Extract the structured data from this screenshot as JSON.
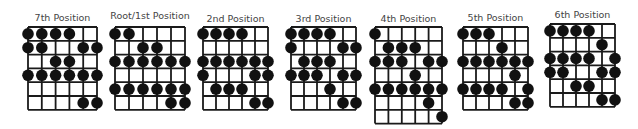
{
  "colors": {
    "line": "#1a1a1a",
    "dot": "#111111",
    "title": "#444444"
  },
  "diagrams": [
    {
      "title": "7th Position",
      "strings": 6,
      "frets": 6,
      "dots": [
        [
          0,
          0
        ],
        [
          0,
          1
        ],
        [
          0,
          2
        ],
        [
          0,
          3
        ],
        [
          1,
          0
        ],
        [
          1,
          1
        ],
        [
          1,
          4
        ],
        [
          1,
          5
        ],
        [
          2,
          2
        ],
        [
          2,
          3
        ],
        [
          3,
          0
        ],
        [
          3,
          1
        ],
        [
          3,
          2
        ],
        [
          3,
          3
        ],
        [
          3,
          4
        ],
        [
          3,
          5
        ],
        [
          5,
          4
        ],
        [
          5,
          5
        ]
      ]
    },
    {
      "title": "Root/1st Position",
      "strings": 6,
      "frets": 6,
      "dots": [
        [
          0,
          0
        ],
        [
          0,
          1
        ],
        [
          1,
          2
        ],
        [
          1,
          3
        ],
        [
          2,
          0
        ],
        [
          2,
          1
        ],
        [
          2,
          2
        ],
        [
          2,
          3
        ],
        [
          2,
          4
        ],
        [
          2,
          5
        ],
        [
          4,
          0
        ],
        [
          4,
          1
        ],
        [
          4,
          2
        ],
        [
          4,
          3
        ],
        [
          4,
          4
        ],
        [
          4,
          5
        ],
        [
          5,
          4
        ],
        [
          5,
          5
        ]
      ]
    },
    {
      "title": "2nd Position",
      "strings": 6,
      "frets": 6,
      "dots": [
        [
          0,
          0
        ],
        [
          0,
          1
        ],
        [
          0,
          2
        ],
        [
          0,
          3
        ],
        [
          2,
          0
        ],
        [
          2,
          1
        ],
        [
          2,
          2
        ],
        [
          2,
          3
        ],
        [
          2,
          4
        ],
        [
          2,
          5
        ],
        [
          3,
          0
        ],
        [
          3,
          4
        ],
        [
          3,
          5
        ],
        [
          4,
          1
        ],
        [
          4,
          2
        ],
        [
          4,
          3
        ],
        [
          5,
          4
        ],
        [
          5,
          5
        ]
      ]
    },
    {
      "title": "3rd Position",
      "strings": 6,
      "frets": 6,
      "dots": [
        [
          0,
          0
        ],
        [
          0,
          1
        ],
        [
          0,
          2
        ],
        [
          0,
          3
        ],
        [
          1,
          0
        ],
        [
          1,
          4
        ],
        [
          1,
          5
        ],
        [
          2,
          1
        ],
        [
          2,
          2
        ],
        [
          2,
          3
        ],
        [
          3,
          0
        ],
        [
          3,
          1
        ],
        [
          3,
          2
        ],
        [
          3,
          4
        ],
        [
          3,
          5
        ],
        [
          4,
          3
        ],
        [
          5,
          4
        ],
        [
          5,
          5
        ]
      ]
    },
    {
      "title": "4th Position",
      "strings": 6,
      "frets": 7,
      "dots": [
        [
          0,
          0
        ],
        [
          1,
          1
        ],
        [
          1,
          2
        ],
        [
          1,
          3
        ],
        [
          2,
          0
        ],
        [
          2,
          1
        ],
        [
          2,
          2
        ],
        [
          2,
          4
        ],
        [
          2,
          5
        ],
        [
          3,
          3
        ],
        [
          4,
          0
        ],
        [
          4,
          1
        ],
        [
          4,
          2
        ],
        [
          4,
          3
        ],
        [
          4,
          4
        ],
        [
          4,
          5
        ],
        [
          5,
          4
        ],
        [
          6,
          5
        ]
      ]
    },
    {
      "title": "5th Position",
      "strings": 6,
      "frets": 6,
      "dots": [
        [
          0,
          0
        ],
        [
          0,
          1
        ],
        [
          0,
          2
        ],
        [
          1,
          3
        ],
        [
          2,
          0
        ],
        [
          2,
          1
        ],
        [
          2,
          2
        ],
        [
          2,
          3
        ],
        [
          2,
          4
        ],
        [
          2,
          5
        ],
        [
          3,
          4
        ],
        [
          4,
          0
        ],
        [
          4,
          1
        ],
        [
          4,
          2
        ],
        [
          4,
          3
        ],
        [
          4,
          5
        ],
        [
          5,
          4
        ],
        [
          5,
          5
        ]
      ]
    },
    {
      "title": "6th Position",
      "strings": 6,
      "frets": 6,
      "dots": [
        [
          0,
          0
        ],
        [
          0,
          1
        ],
        [
          0,
          2
        ],
        [
          0,
          3
        ],
        [
          1,
          4
        ],
        [
          2,
          0
        ],
        [
          2,
          1
        ],
        [
          2,
          2
        ],
        [
          2,
          3
        ],
        [
          2,
          5
        ],
        [
          3,
          0
        ],
        [
          3,
          1
        ],
        [
          3,
          4
        ],
        [
          3,
          5
        ],
        [
          4,
          2
        ],
        [
          4,
          3
        ],
        [
          5,
          4
        ],
        [
          5,
          5
        ]
      ]
    }
  ]
}
